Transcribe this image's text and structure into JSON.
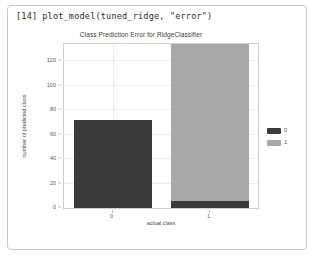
{
  "notebook": {
    "prompt": "[14]",
    "code": "plot_model(tuned_ridge, \"error\")"
  },
  "chart_data": {
    "type": "bar",
    "stacked": true,
    "title": "Class Prediction Error for RidgeClassifier",
    "xlabel": "actual class",
    "ylabel": "number of predicted class",
    "categories": [
      "0",
      "1"
    ],
    "series": [
      {
        "name": "0",
        "values": [
          72,
          6
        ],
        "color": "#3b3b3b"
      },
      {
        "name": "1",
        "values": [
          0,
          129
        ],
        "color": "#a8a8a8"
      }
    ],
    "ylim": [
      0,
      134
    ],
    "yticks": [
      0,
      20,
      40,
      60,
      80,
      100,
      120
    ],
    "ytick_labels": [
      "0",
      "20",
      "40",
      "60",
      "80",
      "100",
      "120"
    ],
    "grid": true,
    "legend_position": "right",
    "legend": [
      {
        "label": "0",
        "color": "#3b3b3b"
      },
      {
        "label": "1",
        "color": "#a8a8a8"
      }
    ]
  }
}
